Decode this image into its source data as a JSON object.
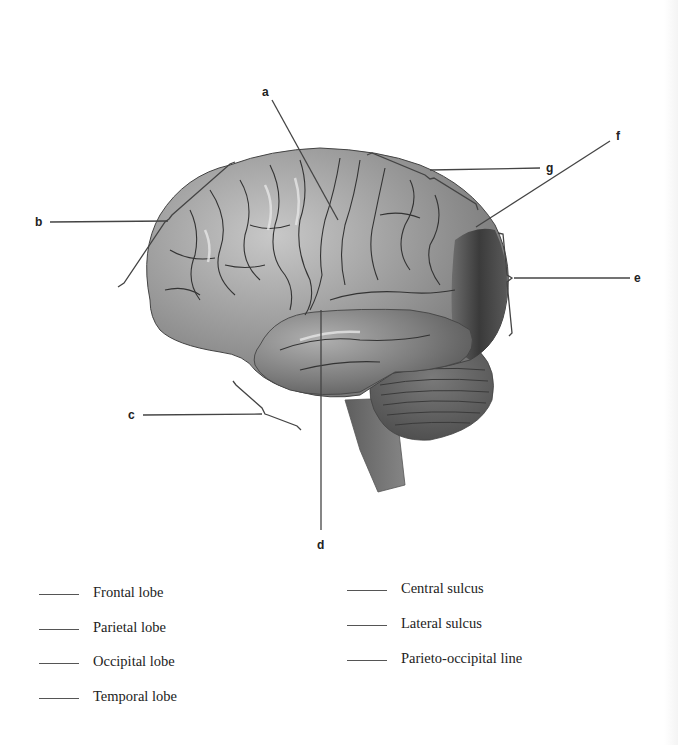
{
  "diagram": {
    "colors": {
      "background": "#ffffff",
      "cerebrum": "#8f8f8f",
      "cerebrum_light": "#b5b5b5",
      "occipital_dark": "#3a3a3a",
      "temporal": "#7a7a7a",
      "cerebellum": "#5c5c5c",
      "brainstem": "#6e6e6e",
      "leader_line": "#444444",
      "sulcus_line": "#333333"
    },
    "labels": {
      "a": "a",
      "b": "b",
      "c": "c",
      "d": "d",
      "e": "e",
      "f": "f",
      "g": "g"
    }
  },
  "answer_key": {
    "left_column": [
      {
        "blank": "",
        "term": "Frontal lobe"
      },
      {
        "blank": "",
        "term": "Parietal lobe"
      },
      {
        "blank": "",
        "term": "Occipital lobe"
      },
      {
        "blank": "",
        "term": "Temporal lobe"
      }
    ],
    "right_column": [
      {
        "blank": "",
        "term": "Central sulcus"
      },
      {
        "blank": "",
        "term": "Lateral sulcus"
      },
      {
        "blank": "",
        "term": "Parieto-occipital line"
      }
    ]
  }
}
